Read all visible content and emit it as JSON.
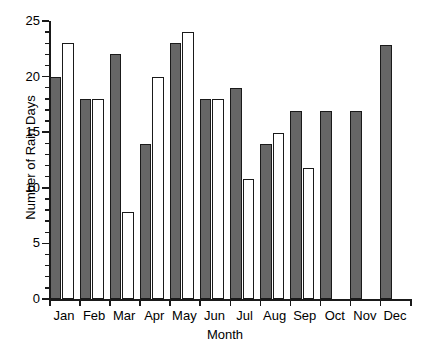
{
  "chart_data": {
    "type": "bar",
    "title": "",
    "xlabel": "Month",
    "ylabel": "Number of Rain Days",
    "categories": [
      "Jan",
      "Feb",
      "Mar",
      "Apr",
      "May",
      "Jun",
      "Jul",
      "Aug",
      "Sep",
      "Oct",
      "Nov",
      "Dec"
    ],
    "series": [
      {
        "name": "Series 1 (shaded)",
        "color": "#666666",
        "values": [
          20,
          18,
          22,
          13.9,
          23,
          18,
          19,
          13.9,
          16.9,
          16.9,
          16.9,
          22.8
        ]
      },
      {
        "name": "Series 2 (open)",
        "color": "#ffffff",
        "values": [
          23,
          18,
          7.8,
          20,
          24,
          18,
          10.8,
          14.9,
          11.8,
          null,
          null,
          null
        ]
      }
    ],
    "ylim": [
      0,
      25
    ],
    "ytick_labels": [
      "0",
      "5",
      "10",
      "15",
      "20",
      "25"
    ],
    "ytick_values": [
      0,
      5,
      10,
      15,
      20,
      25
    ],
    "yminor_step": 1,
    "grid": false,
    "legend": "none"
  },
  "axis": {
    "y_title": "Number of Rain Days",
    "x_title": "Month"
  }
}
